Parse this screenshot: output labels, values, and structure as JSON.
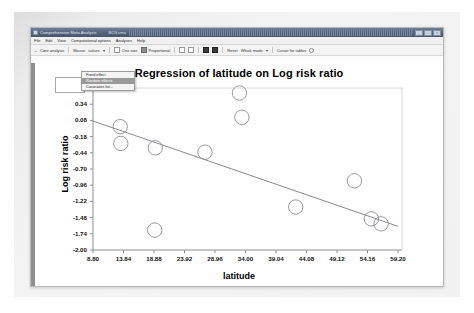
{
  "window": {
    "title": "Comprehensive Meta Analysis",
    "document": "BCG.cma",
    "minimize_label": "_",
    "maximize_label": "□",
    "close_label": "×"
  },
  "menubar": {
    "items": [
      {
        "label": "File"
      },
      {
        "label": "Edit"
      },
      {
        "label": "View"
      },
      {
        "label": "Computational options"
      },
      {
        "label": "Analyses"
      },
      {
        "label": "Help"
      }
    ]
  },
  "menu_panel": {
    "items": [
      {
        "label": "Fixed effect",
        "selected": false
      },
      {
        "label": "Random effects",
        "selected": true
      },
      {
        "label": "Covariates list...",
        "selected": false
      }
    ]
  },
  "toolbar": {
    "back_arrow": "←",
    "core_analysis": "Core analysis",
    "mouse_label": "Mouse",
    "values_label": "values",
    "dropdown_caret": "▾",
    "one_size": "One size",
    "proportional": "Proportional",
    "reset_label": "Reset",
    "whisk_label": "Whisk mode",
    "cursor_label": "Cursor for tables",
    "zoom_label": "↺"
  },
  "row2": {
    "combo_arrow": "▾",
    "combo_text": "Core analysis"
  },
  "chart_data": {
    "type": "scatter",
    "title": "Regression of latitude on Log risk ratio",
    "xlabel": "latitude",
    "ylabel": "Log risk ratio",
    "xlim": [
      8.8,
      59.2
    ],
    "ylim": [
      -2.0,
      0.6
    ],
    "xticks": [
      "8.80",
      "13.84",
      "18.88",
      "23.92",
      "28.96",
      "34.00",
      "39.04",
      "44.08",
      "49.12",
      "54.16",
      "59.20"
    ],
    "xtick_values": [
      8.8,
      13.84,
      18.88,
      23.92,
      28.96,
      34.0,
      39.04,
      44.08,
      49.12,
      54.16,
      59.2
    ],
    "yticks": [
      "0.60",
      "0.34",
      "0.08",
      "-0.18",
      "-0.44",
      "-0.70",
      "-0.96",
      "-1.22",
      "-1.48",
      "-1.74",
      "-2.00"
    ],
    "ytick_values": [
      0.6,
      0.34,
      0.08,
      -0.18,
      -0.44,
      -0.7,
      -0.96,
      -1.22,
      -1.48,
      -1.74,
      -2.0
    ],
    "grid": false,
    "legend": "none",
    "marker": "open-circle",
    "marker_color": "#8d8d98",
    "line_color": "#7a7a86",
    "points": [
      {
        "x": 13.3,
        "y": -0.02
      },
      {
        "x": 13.4,
        "y": -0.29
      },
      {
        "x": 19.1,
        "y": -0.36
      },
      {
        "x": 19.0,
        "y": -1.68
      },
      {
        "x": 27.3,
        "y": -0.43
      },
      {
        "x": 33.0,
        "y": 0.52
      },
      {
        "x": 33.4,
        "y": 0.13
      },
      {
        "x": 42.3,
        "y": -1.31
      },
      {
        "x": 52.0,
        "y": -0.89
      },
      {
        "x": 54.8,
        "y": -1.5
      },
      {
        "x": 56.4,
        "y": -1.58
      }
    ],
    "regression_line": {
      "x1": 8.8,
      "y1": 0.07,
      "x2": 59.2,
      "y2": -1.62
    }
  }
}
